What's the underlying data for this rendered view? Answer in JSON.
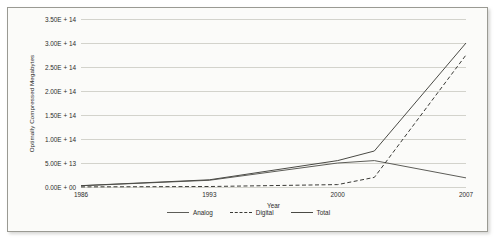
{
  "chart_data": {
    "type": "line",
    "title": "",
    "xlabel": "Year",
    "ylabel": "Optimally Compressed Megabytes",
    "x": [
      1986,
      1993,
      2000,
      2002,
      2007
    ],
    "xlim": [
      1986,
      2007
    ],
    "ylim": [
      0,
      350000000000000
    ],
    "grid": true,
    "legend_position": "bottom",
    "x_tick_labels": [
      "1986",
      "1993",
      "2000",
      "2007"
    ],
    "x_tick_values": [
      1986,
      1993,
      2000,
      2007
    ],
    "y_tick_labels": [
      "0.00E + 00",
      "5.00E + 13",
      "1.00E + 14",
      "1.50E + 14",
      "2.00E + 14",
      "2.50E + 14",
      "3.00E + 14",
      "3.50E + 14"
    ],
    "y_tick_values": [
      0,
      50000000000000,
      100000000000000,
      150000000000000,
      200000000000000,
      250000000000000,
      300000000000000,
      350000000000000
    ],
    "series": [
      {
        "name": "Analog",
        "style": "solid",
        "color": "#5d5d58",
        "values": [
          2600000000000,
          14000000000000,
          50000000000000,
          55000000000000,
          19000000000000
        ]
      },
      {
        "name": "Digital",
        "style": "dashed",
        "color": "#3a3a36",
        "values": [
          200000000000,
          1000000000000,
          5000000000000,
          20000000000000,
          275000000000000
        ]
      },
      {
        "name": "Total",
        "style": "solid",
        "color": "#4a4a45",
        "values": [
          2800000000000,
          15000000000000,
          55000000000000,
          75000000000000,
          300000000000000
        ]
      }
    ]
  },
  "legend": {
    "items": [
      {
        "label": "Analog"
      },
      {
        "label": "Digital"
      },
      {
        "label": "Total"
      }
    ]
  }
}
